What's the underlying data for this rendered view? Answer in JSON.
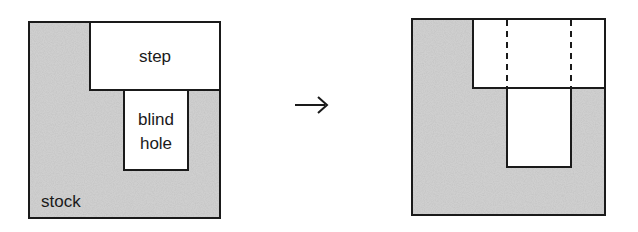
{
  "diagram": {
    "type": "feature-interaction",
    "left": {
      "labels": {
        "step": "step",
        "blind_hole_line1": "blind",
        "blind_hole_line2": "hole",
        "stock": "stock"
      },
      "stock_box": {
        "x": 29,
        "y": 22,
        "w": 191,
        "h": 196
      },
      "step_box": {
        "x": 90,
        "y": 22,
        "w": 130,
        "h": 68
      },
      "hole_box": {
        "x": 124,
        "y": 90,
        "w": 64,
        "h": 80
      }
    },
    "arrow": {
      "glyph": "→"
    },
    "right": {
      "stock_box": {
        "x": 412,
        "y": 19,
        "w": 193,
        "h": 196
      },
      "step_box": {
        "x": 473,
        "y": 19,
        "w": 132,
        "h": 69
      },
      "hole_box": {
        "x": 507,
        "y": 88,
        "w": 64,
        "h": 79
      },
      "dashed_lines_x": [
        506,
        570
      ]
    },
    "colors": {
      "stock_fill": "#c8c8c8",
      "line": "#1a1a1a",
      "background": "#ffffff"
    }
  }
}
